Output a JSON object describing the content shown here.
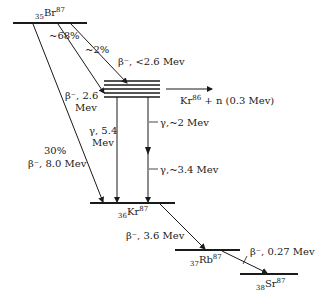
{
  "diagram": {
    "type": "nuclear-decay-scheme",
    "nuclides": [
      {
        "id": "br87",
        "Z": "35",
        "symbol": "Br",
        "A": "87"
      },
      {
        "id": "kr87",
        "Z": "36",
        "symbol": "Kr",
        "A": "87"
      },
      {
        "id": "rb87",
        "Z": "37",
        "symbol": "Rb",
        "A": "87"
      },
      {
        "id": "sr87",
        "Z": "38",
        "symbol": "Sr",
        "A": "87"
      }
    ],
    "branches": {
      "b68": "~68%",
      "b2": "~2%",
      "b30": "30%"
    },
    "transitions": {
      "beta_lt26": "β⁻, <2.6 Mev",
      "beta_26_a": "β⁻, 2.6",
      "beta_26_b": "Mev",
      "beta_80": "β⁻, 8.0 Mev",
      "gamma_54_a": "γ, 5.4",
      "gamma_54_b": "Mev",
      "gamma_2": "γ,~2 Mev",
      "gamma_34": "γ,~3.4 Mev",
      "beta_36": "β⁻, 3.6 Mev",
      "beta_027": "β⁻, 0.27 Mev"
    },
    "neutron_emission": {
      "product_symbol": "Kr",
      "product_A": "86",
      "rest": " + n (0.3 Mev)"
    }
  }
}
